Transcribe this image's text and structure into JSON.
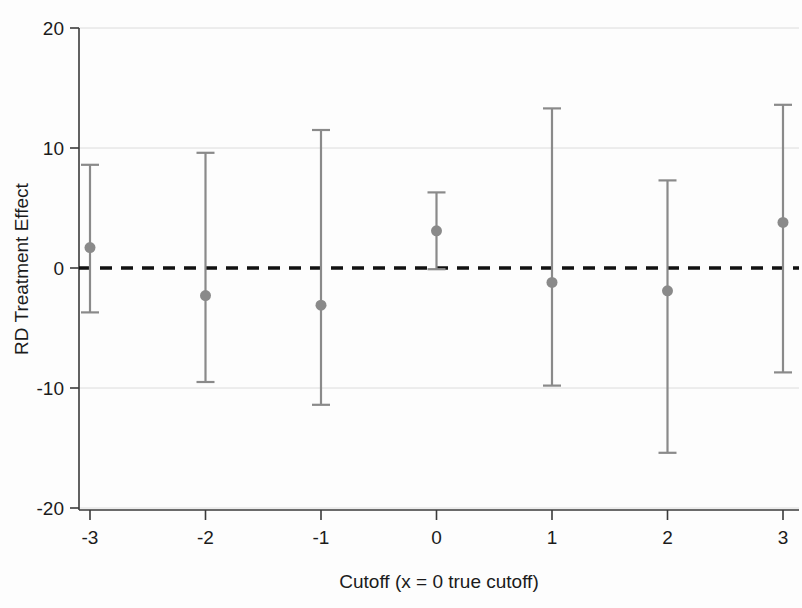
{
  "chart_data": {
    "type": "scatter",
    "title": "",
    "subtitle": "",
    "xlabel": "Cutoff (x = 0 true cutoff)",
    "ylabel": "RD Treatment Effect",
    "xlim": [
      -3.45,
      3.45
    ],
    "ylim": [
      -21.0,
      21.0
    ],
    "xticks": [
      -3,
      -2,
      -1,
      0,
      1,
      2,
      3
    ],
    "xticklabels": [
      "-3",
      "-2",
      "-1",
      "0",
      "1",
      "2",
      "3"
    ],
    "yticks": [
      -20,
      -10,
      0,
      10,
      20
    ],
    "yticklabels": [
      "-20",
      "-10",
      "0",
      "10",
      "20"
    ],
    "grid": "horizontal-faint",
    "legend": "none",
    "reference_line": {
      "name": "zero-line",
      "y": 0,
      "style": "dashed",
      "color": "#111111"
    },
    "marker": {
      "shape": "circle",
      "color": "#8a8a8a",
      "size": 11
    },
    "errorbar": {
      "color": "#8a8a8a",
      "capped": true
    },
    "x": [
      -3,
      -2,
      -1,
      0,
      1,
      2,
      3
    ],
    "values": [
      1.7,
      -2.3,
      -3.1,
      3.1,
      -1.2,
      -1.9,
      3.8
    ],
    "ci_low": [
      -3.7,
      -9.5,
      -11.4,
      -0.1,
      -9.8,
      -15.4,
      -8.7
    ],
    "ci_high": [
      8.6,
      9.6,
      11.5,
      6.3,
      13.3,
      7.3,
      13.6
    ],
    "points": [
      {
        "x": -3,
        "estimate": 1.7,
        "ci_low": -3.7,
        "ci_high": 8.6
      },
      {
        "x": -2,
        "estimate": -2.3,
        "ci_low": -9.5,
        "ci_high": 9.6
      },
      {
        "x": -1,
        "estimate": -3.1,
        "ci_low": -11.4,
        "ci_high": 11.5
      },
      {
        "x": 0,
        "estimate": 3.1,
        "ci_low": -0.1,
        "ci_high": 6.3
      },
      {
        "x": 1,
        "estimate": -1.2,
        "ci_low": -9.8,
        "ci_high": 13.3
      },
      {
        "x": 2,
        "estimate": -1.9,
        "ci_low": -15.4,
        "ci_high": 7.3
      },
      {
        "x": 3,
        "estimate": 3.8,
        "ci_low": -8.7,
        "ci_high": 13.6
      }
    ]
  },
  "colors": {
    "marker": "#8a8a8a",
    "errorbar": "#8a8a8a",
    "axis": "#3a3a3a",
    "zero_line": "#111111",
    "gridline": "#dcdcdc",
    "text": "#1b1b1b",
    "background": "#fdfdfd"
  }
}
